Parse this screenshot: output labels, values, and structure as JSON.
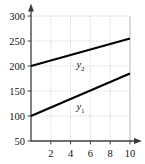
{
  "chart_data": {
    "type": "line",
    "title": "",
    "xlabel": "",
    "ylabel": "",
    "xlim": [
      0,
      10.6
    ],
    "ylim": [
      0,
      312
    ],
    "grid": true,
    "grid_style": "dotted",
    "legend": "inline-labels",
    "x_ticks": [
      2,
      4,
      6,
      8,
      10
    ],
    "x_tick_labels": [
      "2",
      "4",
      "6",
      "8",
      "10"
    ],
    "y_ticks": [
      50,
      100,
      150,
      200,
      250,
      300
    ],
    "y_tick_labels": [
      "50",
      "100",
      "150",
      "200",
      "250",
      "300"
    ],
    "line_color": "#000000",
    "grid_color": "#b9b9b9",
    "axis_color": "#4a4a4a",
    "series": [
      {
        "name": "y2",
        "label": "y",
        "subscript": "2",
        "x": [
          0,
          10
        ],
        "values": [
          200,
          255
        ],
        "label_x": 5.0,
        "label_y": 196
      },
      {
        "name": "y1",
        "label": "y",
        "subscript": "1",
        "x": [
          0,
          10
        ],
        "values": [
          100,
          185
        ],
        "label_x": 5.0,
        "label_y": 112
      }
    ]
  }
}
